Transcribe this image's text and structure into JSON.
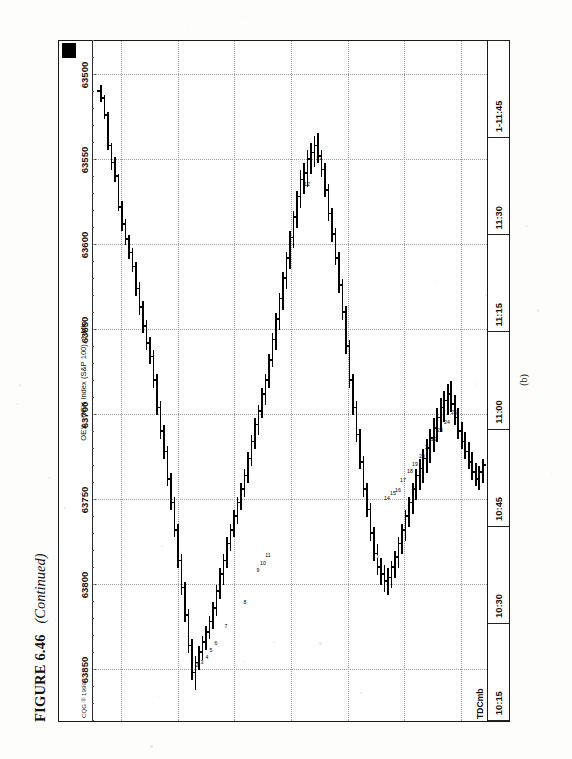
{
  "page": {
    "background_color": "#fdfdfc",
    "ink_color": "#111111"
  },
  "caption": {
    "figure_number": "FIGURE 6.46",
    "continued": "(Continued)"
  },
  "subfigure_label": "(b)",
  "chart_header": {
    "copyright": "CQG ® 1999",
    "title": "OEX - OEX Index (S&P 100), 1 Min",
    "corner_marker": "black-square"
  },
  "symbol_label": "TDCmb",
  "chart_data": {
    "type": "bar",
    "subtype": "ohlc",
    "title": "OEX - OEX Index (S&P 100), 1 Min",
    "xlabel": "",
    "ylabel": "",
    "grid": true,
    "legend_position": "none",
    "orientation": "rotated-90-ccw-on-page",
    "ylim": [
      63480,
      63880
    ],
    "ytick_labels": [
      "63850",
      "63800",
      "63750",
      "63700",
      "63650",
      "63600",
      "63550",
      "63500"
    ],
    "ytick_values": [
      63850,
      63800,
      63750,
      63700,
      63650,
      63600,
      63550,
      63500
    ],
    "xtick_labels": [
      "10:15",
      "10:30",
      "10:45",
      "11:00",
      "11:15",
      "11:30",
      "1-11:45"
    ],
    "xlim_label_start": "10:15",
    "xlim_label_end": "1-11:45",
    "annotations": [
      {
        "label": "1",
        "x": 26.3,
        "y": 63848
      },
      {
        "label": "2",
        "x": 27.8,
        "y": 63843
      },
      {
        "label": "3",
        "x": 29.0,
        "y": 63841
      },
      {
        "label": "4",
        "x": 30.4,
        "y": 63838
      },
      {
        "label": "5",
        "x": 31.6,
        "y": 63834
      },
      {
        "label": "6",
        "x": 33.0,
        "y": 63830
      },
      {
        "label": "7",
        "x": 36.0,
        "y": 63820
      },
      {
        "label": "8",
        "x": 41.5,
        "y": 63806
      },
      {
        "label": "9",
        "x": 45.0,
        "y": 63787
      },
      {
        "label": "10",
        "x": 46.4,
        "y": 63783
      },
      {
        "label": "11",
        "x": 48.0,
        "y": 63778
      },
      {
        "label": "12",
        "x": 59.0,
        "y": 63560
      },
      {
        "label": "13",
        "x": 62.5,
        "y": 63545
      },
      {
        "label": "14",
        "x": 82.0,
        "y": 63745
      },
      {
        "label": "15",
        "x": 83.5,
        "y": 63742
      },
      {
        "label": "16",
        "x": 85.0,
        "y": 63740
      },
      {
        "label": "17",
        "x": 86.5,
        "y": 63734
      },
      {
        "label": "18",
        "x": 88.5,
        "y": 63729
      },
      {
        "label": "19",
        "x": 90.0,
        "y": 63725
      },
      {
        "label": "20",
        "x": 92.0,
        "y": 63720
      },
      {
        "label": "21",
        "x": 93.6,
        "y": 63715
      },
      {
        "label": "22",
        "x": 95.2,
        "y": 63710
      },
      {
        "label": "23",
        "x": 97.0,
        "y": 63705
      },
      {
        "label": "24",
        "x": 99.0,
        "y": 63700
      },
      {
        "label": "25",
        "x": 101.0,
        "y": 63694
      }
    ],
    "bars": [
      {
        "i": 0,
        "o": 63510,
        "h": 63516,
        "l": 63506,
        "c": 63514
      },
      {
        "i": 1,
        "o": 63514,
        "h": 63526,
        "l": 63512,
        "c": 63524
      },
      {
        "i": 2,
        "o": 63524,
        "h": 63544,
        "l": 63522,
        "c": 63542
      },
      {
        "i": 3,
        "o": 63542,
        "h": 63556,
        "l": 63540,
        "c": 63552
      },
      {
        "i": 4,
        "o": 63552,
        "h": 63563,
        "l": 63548,
        "c": 63560
      },
      {
        "i": 5,
        "o": 63560,
        "h": 63580,
        "l": 63558,
        "c": 63578
      },
      {
        "i": 6,
        "o": 63578,
        "h": 63592,
        "l": 63574,
        "c": 63588
      },
      {
        "i": 7,
        "o": 63588,
        "h": 63600,
        "l": 63585,
        "c": 63597
      },
      {
        "i": 8,
        "o": 63597,
        "h": 63608,
        "l": 63594,
        "c": 63605
      },
      {
        "i": 9,
        "o": 63605,
        "h": 63616,
        "l": 63602,
        "c": 63613
      },
      {
        "i": 10,
        "o": 63613,
        "h": 63630,
        "l": 63610,
        "c": 63626
      },
      {
        "i": 11,
        "o": 63626,
        "h": 63641,
        "l": 63622,
        "c": 63637
      },
      {
        "i": 12,
        "o": 63637,
        "h": 63652,
        "l": 63633,
        "c": 63648
      },
      {
        "i": 13,
        "o": 63648,
        "h": 63662,
        "l": 63644,
        "c": 63658
      },
      {
        "i": 14,
        "o": 63658,
        "h": 63670,
        "l": 63654,
        "c": 63666
      },
      {
        "i": 15,
        "o": 63666,
        "h": 63684,
        "l": 63662,
        "c": 63680
      },
      {
        "i": 16,
        "o": 63680,
        "h": 63700,
        "l": 63676,
        "c": 63696
      },
      {
        "i": 17,
        "o": 63696,
        "h": 63714,
        "l": 63692,
        "c": 63710
      },
      {
        "i": 18,
        "o": 63710,
        "h": 63726,
        "l": 63706,
        "c": 63722
      },
      {
        "i": 19,
        "o": 63722,
        "h": 63742,
        "l": 63718,
        "c": 63738
      },
      {
        "i": 20,
        "o": 63738,
        "h": 63756,
        "l": 63734,
        "c": 63752
      },
      {
        "i": 21,
        "o": 63752,
        "h": 63772,
        "l": 63748,
        "c": 63768
      },
      {
        "i": 22,
        "o": 63768,
        "h": 63790,
        "l": 63764,
        "c": 63786
      },
      {
        "i": 23,
        "o": 63786,
        "h": 63806,
        "l": 63782,
        "c": 63802
      },
      {
        "i": 24,
        "o": 63802,
        "h": 63822,
        "l": 63798,
        "c": 63818
      },
      {
        "i": 25,
        "o": 63818,
        "h": 63840,
        "l": 63814,
        "c": 63836
      },
      {
        "i": 26,
        "o": 63836,
        "h": 63856,
        "l": 63832,
        "c": 63852
      },
      {
        "i": 27,
        "o": 63852,
        "h": 63862,
        "l": 63842,
        "c": 63846
      },
      {
        "i": 28,
        "o": 63846,
        "h": 63850,
        "l": 63836,
        "c": 63840
      },
      {
        "i": 29,
        "o": 63840,
        "h": 63844,
        "l": 63830,
        "c": 63834
      },
      {
        "i": 30,
        "o": 63834,
        "h": 63838,
        "l": 63824,
        "c": 63828
      },
      {
        "i": 31,
        "o": 63828,
        "h": 63832,
        "l": 63818,
        "c": 63822
      },
      {
        "i": 32,
        "o": 63822,
        "h": 63826,
        "l": 63810,
        "c": 63814
      },
      {
        "i": 33,
        "o": 63814,
        "h": 63818,
        "l": 63800,
        "c": 63804
      },
      {
        "i": 34,
        "o": 63804,
        "h": 63808,
        "l": 63790,
        "c": 63794
      },
      {
        "i": 35,
        "o": 63794,
        "h": 63800,
        "l": 63782,
        "c": 63786
      },
      {
        "i": 36,
        "o": 63786,
        "h": 63790,
        "l": 63772,
        "c": 63776
      },
      {
        "i": 37,
        "o": 63776,
        "h": 63780,
        "l": 63764,
        "c": 63768
      },
      {
        "i": 38,
        "o": 63768,
        "h": 63772,
        "l": 63756,
        "c": 63760
      },
      {
        "i": 39,
        "o": 63760,
        "h": 63764,
        "l": 63748,
        "c": 63752
      },
      {
        "i": 40,
        "o": 63752,
        "h": 63756,
        "l": 63740,
        "c": 63744
      },
      {
        "i": 41,
        "o": 63744,
        "h": 63748,
        "l": 63732,
        "c": 63736
      },
      {
        "i": 42,
        "o": 63736,
        "h": 63740,
        "l": 63722,
        "c": 63726
      },
      {
        "i": 43,
        "o": 63726,
        "h": 63730,
        "l": 63712,
        "c": 63716
      },
      {
        "i": 44,
        "o": 63716,
        "h": 63720,
        "l": 63702,
        "c": 63706
      },
      {
        "i": 45,
        "o": 63706,
        "h": 63712,
        "l": 63694,
        "c": 63698
      },
      {
        "i": 46,
        "o": 63698,
        "h": 63702,
        "l": 63684,
        "c": 63688
      },
      {
        "i": 47,
        "o": 63688,
        "h": 63694,
        "l": 63676,
        "c": 63680
      },
      {
        "i": 48,
        "o": 63680,
        "h": 63684,
        "l": 63664,
        "c": 63668
      },
      {
        "i": 49,
        "o": 63668,
        "h": 63672,
        "l": 63652,
        "c": 63656
      },
      {
        "i": 50,
        "o": 63656,
        "h": 63662,
        "l": 63640,
        "c": 63644
      },
      {
        "i": 51,
        "o": 63644,
        "h": 63650,
        "l": 63628,
        "c": 63632
      },
      {
        "i": 52,
        "o": 63632,
        "h": 63638,
        "l": 63616,
        "c": 63620
      },
      {
        "i": 53,
        "o": 63620,
        "h": 63626,
        "l": 63604,
        "c": 63608
      },
      {
        "i": 54,
        "o": 63608,
        "h": 63614,
        "l": 63592,
        "c": 63596
      },
      {
        "i": 55,
        "o": 63596,
        "h": 63602,
        "l": 63580,
        "c": 63584
      },
      {
        "i": 56,
        "o": 63584,
        "h": 63590,
        "l": 63568,
        "c": 63572
      },
      {
        "i": 57,
        "o": 63572,
        "h": 63578,
        "l": 63556,
        "c": 63562
      },
      {
        "i": 58,
        "o": 63562,
        "h": 63570,
        "l": 63552,
        "c": 63558
      },
      {
        "i": 59,
        "o": 63558,
        "h": 63566,
        "l": 63544,
        "c": 63550
      },
      {
        "i": 60,
        "o": 63550,
        "h": 63558,
        "l": 63540,
        "c": 63546
      },
      {
        "i": 61,
        "o": 63546,
        "h": 63554,
        "l": 63536,
        "c": 63542
      },
      {
        "i": 62,
        "o": 63542,
        "h": 63552,
        "l": 63534,
        "c": 63548
      },
      {
        "i": 63,
        "o": 63548,
        "h": 63560,
        "l": 63544,
        "c": 63556
      },
      {
        "i": 64,
        "o": 63556,
        "h": 63572,
        "l": 63552,
        "c": 63568
      },
      {
        "i": 65,
        "o": 63568,
        "h": 63586,
        "l": 63564,
        "c": 63582
      },
      {
        "i": 66,
        "o": 63582,
        "h": 63598,
        "l": 63578,
        "c": 63594
      },
      {
        "i": 67,
        "o": 63594,
        "h": 63612,
        "l": 63590,
        "c": 63608
      },
      {
        "i": 68,
        "o": 63608,
        "h": 63628,
        "l": 63604,
        "c": 63624
      },
      {
        "i": 69,
        "o": 63624,
        "h": 63644,
        "l": 63620,
        "c": 63640
      },
      {
        "i": 70,
        "o": 63640,
        "h": 63664,
        "l": 63636,
        "c": 63660
      },
      {
        "i": 71,
        "o": 63660,
        "h": 63684,
        "l": 63656,
        "c": 63680
      },
      {
        "i": 72,
        "o": 63680,
        "h": 63700,
        "l": 63676,
        "c": 63696
      },
      {
        "i": 73,
        "o": 63696,
        "h": 63716,
        "l": 63692,
        "c": 63712
      },
      {
        "i": 74,
        "o": 63712,
        "h": 63732,
        "l": 63708,
        "c": 63728
      },
      {
        "i": 75,
        "o": 63728,
        "h": 63748,
        "l": 63724,
        "c": 63744
      },
      {
        "i": 76,
        "o": 63744,
        "h": 63760,
        "l": 63740,
        "c": 63756
      },
      {
        "i": 77,
        "o": 63756,
        "h": 63774,
        "l": 63752,
        "c": 63770
      },
      {
        "i": 78,
        "o": 63770,
        "h": 63786,
        "l": 63766,
        "c": 63782
      },
      {
        "i": 79,
        "o": 63782,
        "h": 63794,
        "l": 63776,
        "c": 63790
      },
      {
        "i": 80,
        "o": 63790,
        "h": 63800,
        "l": 63784,
        "c": 63794
      },
      {
        "i": 81,
        "o": 63794,
        "h": 63804,
        "l": 63788,
        "c": 63798
      },
      {
        "i": 82,
        "o": 63798,
        "h": 63806,
        "l": 63790,
        "c": 63796
      },
      {
        "i": 83,
        "o": 63796,
        "h": 63802,
        "l": 63786,
        "c": 63790
      },
      {
        "i": 84,
        "o": 63790,
        "h": 63796,
        "l": 63780,
        "c": 63784
      },
      {
        "i": 85,
        "o": 63784,
        "h": 63790,
        "l": 63772,
        "c": 63776
      },
      {
        "i": 86,
        "o": 63776,
        "h": 63782,
        "l": 63764,
        "c": 63768
      },
      {
        "i": 87,
        "o": 63768,
        "h": 63774,
        "l": 63756,
        "c": 63760
      },
      {
        "i": 88,
        "o": 63760,
        "h": 63766,
        "l": 63748,
        "c": 63752
      },
      {
        "i": 89,
        "o": 63752,
        "h": 63758,
        "l": 63740,
        "c": 63744
      },
      {
        "i": 90,
        "o": 63744,
        "h": 63750,
        "l": 63732,
        "c": 63736
      },
      {
        "i": 91,
        "o": 63736,
        "h": 63744,
        "l": 63726,
        "c": 63732
      },
      {
        "i": 92,
        "o": 63732,
        "h": 63740,
        "l": 63720,
        "c": 63726
      },
      {
        "i": 93,
        "o": 63726,
        "h": 63734,
        "l": 63714,
        "c": 63720
      },
      {
        "i": 94,
        "o": 63720,
        "h": 63728,
        "l": 63708,
        "c": 63714
      },
      {
        "i": 95,
        "o": 63714,
        "h": 63722,
        "l": 63702,
        "c": 63708
      },
      {
        "i": 96,
        "o": 63708,
        "h": 63716,
        "l": 63696,
        "c": 63702
      },
      {
        "i": 97,
        "o": 63702,
        "h": 63710,
        "l": 63690,
        "c": 63696
      },
      {
        "i": 98,
        "o": 63696,
        "h": 63704,
        "l": 63686,
        "c": 63692
      },
      {
        "i": 99,
        "o": 63692,
        "h": 63700,
        "l": 63682,
        "c": 63688
      },
      {
        "i": 100,
        "o": 63688,
        "h": 63698,
        "l": 63680,
        "c": 63694
      },
      {
        "i": 101,
        "o": 63694,
        "h": 63706,
        "l": 63688,
        "c": 63702
      },
      {
        "i": 102,
        "o": 63702,
        "h": 63714,
        "l": 63696,
        "c": 63710
      },
      {
        "i": 103,
        "o": 63710,
        "h": 63720,
        "l": 63704,
        "c": 63716
      },
      {
        "i": 104,
        "o": 63716,
        "h": 63726,
        "l": 63710,
        "c": 63722
      },
      {
        "i": 105,
        "o": 63722,
        "h": 63732,
        "l": 63716,
        "c": 63728
      },
      {
        "i": 106,
        "o": 63728,
        "h": 63738,
        "l": 63722,
        "c": 63734
      },
      {
        "i": 107,
        "o": 63734,
        "h": 63742,
        "l": 63728,
        "c": 63738
      },
      {
        "i": 108,
        "o": 63738,
        "h": 63744,
        "l": 63730,
        "c": 63734
      },
      {
        "i": 109,
        "o": 63734,
        "h": 63740,
        "l": 63726,
        "c": 63730
      }
    ]
  }
}
